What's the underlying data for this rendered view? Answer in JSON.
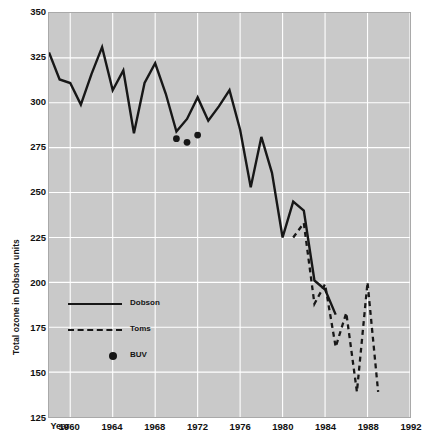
{
  "chart_data": {
    "type": "line",
    "title": "",
    "xlabel": "Year",
    "ylabel": "Total ozone in Dobson units",
    "xlim": [
      1958,
      1992
    ],
    "ylim": [
      125,
      350
    ],
    "xticks": [
      1960,
      1964,
      1968,
      1972,
      1976,
      1980,
      1984,
      1988,
      1992
    ],
    "xtick_labels": [
      "1960",
      "1964",
      "1968",
      "1972",
      "1976",
      "1980",
      "1984",
      "1988",
      "1992"
    ],
    "yticks": [
      125,
      150,
      175,
      200,
      225,
      250,
      275,
      300,
      325,
      350
    ],
    "ytick_labels": [
      "125",
      "150",
      "175",
      "200",
      "225",
      "250",
      "275",
      "300",
      "325",
      "350"
    ],
    "grid": true,
    "grid_color": "#ffffff",
    "plot_bgcolor": "#c9c9c9",
    "line_color": "#171717",
    "legend_position": "lower-left",
    "series": [
      {
        "name": "Dobson",
        "style": "solid",
        "x": [
          1958,
          1959,
          1960,
          1961,
          1962,
          1963,
          1964,
          1965,
          1966,
          1967,
          1968,
          1969,
          1970,
          1971,
          1972,
          1973,
          1974,
          1975,
          1976,
          1977,
          1978,
          1979,
          1980,
          1981,
          1982,
          1983,
          1984,
          1985
        ],
        "values": [
          328,
          313,
          311,
          299,
          316,
          331,
          307,
          318,
          283,
          311,
          322,
          305,
          284,
          291,
          303,
          290,
          298,
          307,
          285,
          253,
          281,
          261,
          225,
          245,
          240,
          201,
          196,
          182
        ]
      },
      {
        "name": "Toms",
        "style": "dashed",
        "x": [
          1981,
          1982,
          1983,
          1984,
          1985,
          1986,
          1987,
          1988,
          1989
        ],
        "values": [
          225,
          233,
          188,
          199,
          164,
          183,
          139,
          200,
          139
        ]
      },
      {
        "name": "BUV",
        "style": "markers",
        "x": [
          1970,
          1971,
          1972
        ],
        "values": [
          280,
          278,
          282
        ]
      }
    ]
  },
  "legend": {
    "items": [
      {
        "label": "Dobson",
        "style": "solid"
      },
      {
        "label": "Toms",
        "style": "dashed"
      },
      {
        "label": "BUV",
        "style": "dot"
      }
    ]
  },
  "axes": {
    "year_word": "Year"
  }
}
